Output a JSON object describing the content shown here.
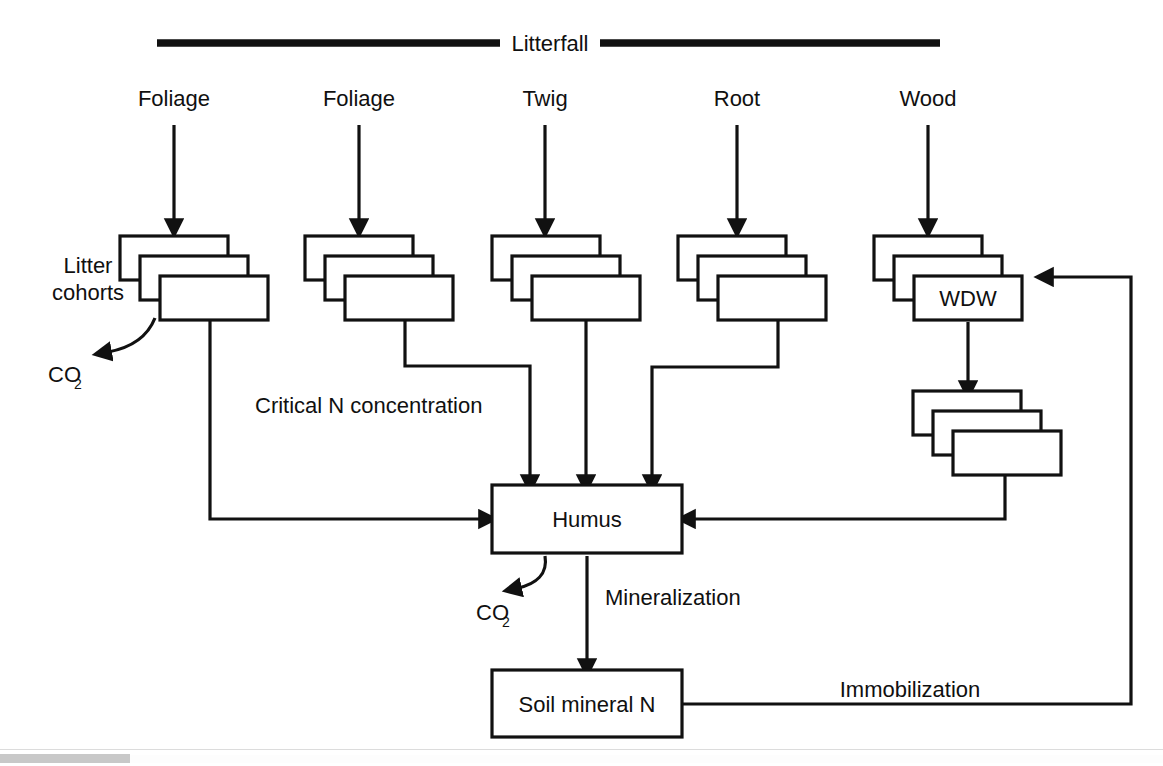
{
  "figure": {
    "title": "Litterfall",
    "columns": [
      {
        "label": "Foliage"
      },
      {
        "label": "Foliage"
      },
      {
        "label": "Twig"
      },
      {
        "label": "Root"
      },
      {
        "label": "Wood"
      }
    ],
    "labels": {
      "litter_cohorts_line1": "Litter",
      "litter_cohorts_line2": "cohorts",
      "co2_main": "CO",
      "co2_sub": "2",
      "critical_n": "Critical N concentration",
      "wdw": "WDW",
      "humus": "Humus",
      "mineralization": "Mineralization",
      "soil_mineral_n": "Soil mineral N",
      "immobilization": "Immobilization",
      "co2_humus": "CO",
      "co2_humus_sub": "2"
    },
    "colors": {
      "ink": "#111111",
      "paper": "#ffffff",
      "scrollbar_thumb": "#c8c8c8"
    }
  }
}
